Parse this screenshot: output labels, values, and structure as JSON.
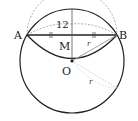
{
  "diagram": {
    "labels": {
      "A": "A",
      "B": "B",
      "M": "M",
      "O": "O",
      "length": "12",
      "r1": "r",
      "r2": "r"
    },
    "colors": {
      "stroke": "#222222",
      "dashed": "#999999",
      "light": "#bbbbbb"
    }
  }
}
